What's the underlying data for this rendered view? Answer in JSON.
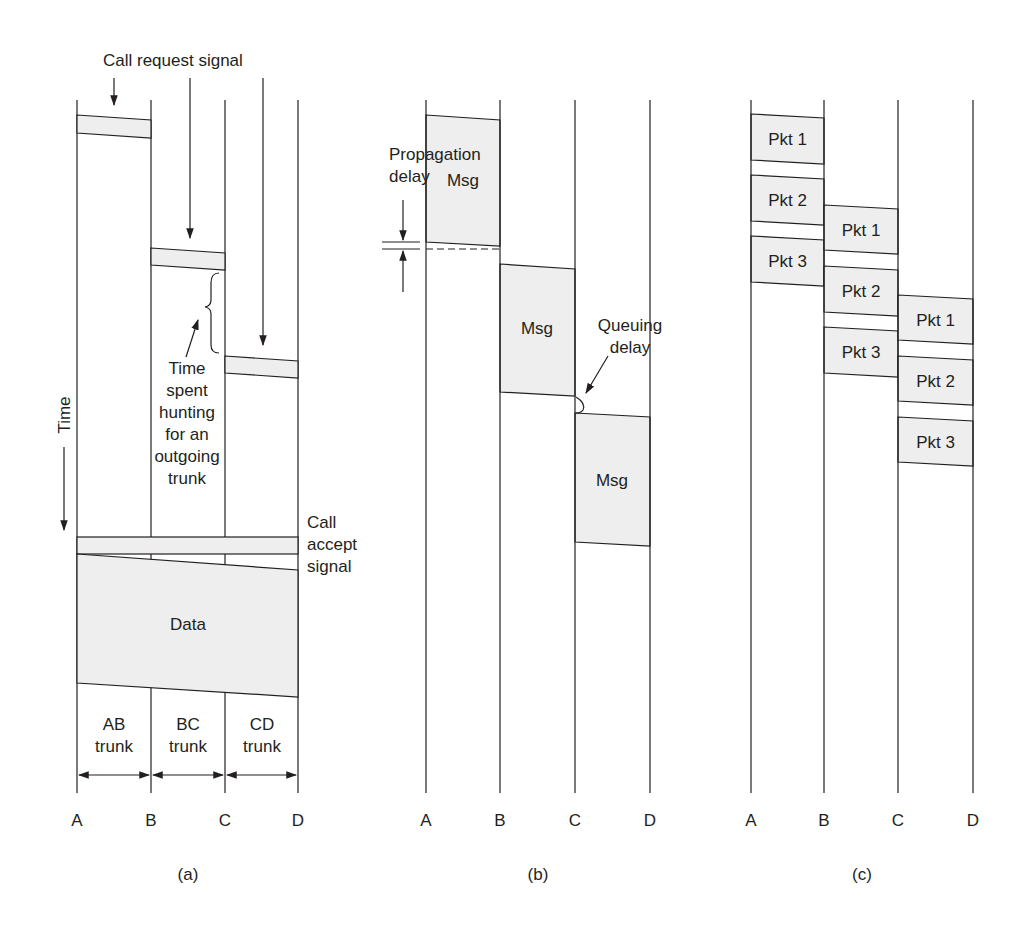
{
  "colors": {
    "ink": "#231f20",
    "fill": "#eeeeee",
    "background": "#ffffff"
  },
  "panels": [
    {
      "id": "a",
      "caption": "(a)",
      "caption_pos": [
        188,
        880
      ],
      "nodes": [
        {
          "label": "A",
          "x": 77
        },
        {
          "label": "B",
          "x": 151
        },
        {
          "label": "C",
          "x": 225
        },
        {
          "label": "D",
          "x": 298
        }
      ],
      "line_top": 100,
      "line_bottom": 793,
      "node_label_y": 826,
      "signal_boxes": [
        {
          "x1": 77,
          "x2": 151,
          "top": [
            115,
            120
          ],
          "bottom": [
            133,
            138
          ]
        },
        {
          "x1": 151,
          "x2": 225,
          "top": [
            248,
            253
          ],
          "bottom": [
            265,
            270
          ]
        },
        {
          "x1": 225,
          "x2": 298,
          "top": [
            356,
            361
          ],
          "bottom": [
            373,
            378
          ]
        }
      ],
      "call_accept_band": {
        "x1": 77,
        "x2": 298,
        "top": 537,
        "bottom": 554
      },
      "data_block": {
        "x1": 77,
        "x2": 298,
        "top": [
          554,
          570
        ],
        "bottom": [
          683,
          697
        ],
        "label": "Data",
        "label_pos": [
          188,
          630
        ]
      },
      "labels": {
        "call_request": {
          "text": "Call request signal",
          "x": 103,
          "y": 66
        },
        "call_accept": {
          "lines": [
            "Call",
            "accept",
            "signal"
          ],
          "x": 307,
          "y": 528,
          "line_height": 22
        },
        "hunting": {
          "lines": [
            "Time",
            "spent",
            "hunting",
            "for an",
            "outgoing",
            "trunk"
          ],
          "x": 187,
          "y": 374,
          "line_height": 22
        },
        "time_axis": {
          "text": "Time",
          "x": 70,
          "y": 415
        }
      },
      "trunks": [
        {
          "lines": [
            "AB",
            "trunk"
          ],
          "x": 114
        },
        {
          "lines": [
            "BC",
            "trunk"
          ],
          "x": 188
        },
        {
          "lines": [
            "CD",
            "trunk"
          ],
          "x": 262
        }
      ],
      "trunk_label_y": 730,
      "trunk_arrow_y": 775
    },
    {
      "id": "b",
      "caption": "(b)",
      "caption_pos": [
        538,
        880
      ],
      "nodes": [
        {
          "label": "A",
          "x": 426
        },
        {
          "label": "B",
          "x": 500
        },
        {
          "label": "C",
          "x": 575
        },
        {
          "label": "D",
          "x": 650
        }
      ],
      "line_top": 100,
      "line_bottom": 793,
      "node_label_y": 826,
      "msg_boxes": [
        {
          "x1": 426,
          "x2": 500,
          "top": [
            115,
            120
          ],
          "bottom": [
            242,
            246
          ],
          "label": "Msg",
          "label_pos": [
            463,
            186
          ]
        },
        {
          "x1": 500,
          "x2": 575,
          "top": [
            264,
            269
          ],
          "bottom": [
            392,
            396
          ],
          "label": "Msg",
          "label_pos": [
            537,
            334
          ]
        },
        {
          "x1": 575,
          "x2": 650,
          "top": [
            413,
            417
          ],
          "bottom": [
            542,
            546
          ],
          "label": "Msg",
          "label_pos": [
            612,
            486
          ]
        }
      ],
      "labels": {
        "propagation": {
          "lines": [
            "Propagation",
            "delay"
          ],
          "x": 389,
          "y": 160,
          "line_height": 22
        },
        "queuing": {
          "lines": [
            "Queuing",
            "delay"
          ],
          "x": 630,
          "y": 331,
          "line_height": 22
        }
      },
      "propagation_marker": {
        "x1": 382,
        "x2": 420,
        "y_top": 242,
        "y_bottom": 249,
        "dash_x1": 426,
        "dash_x2": 500
      }
    },
    {
      "id": "c",
      "caption": "(c)",
      "caption_pos": [
        862,
        880
      ],
      "nodes": [
        {
          "label": "A",
          "x": 751
        },
        {
          "label": "B",
          "x": 824
        },
        {
          "label": "C",
          "x": 898
        },
        {
          "label": "D",
          "x": 973
        }
      ],
      "line_top": 100,
      "line_bottom": 793,
      "node_label_y": 826,
      "packets": [
        {
          "x1": 751,
          "x2": 824,
          "top": [
            114,
            118
          ],
          "bottom": [
            160,
            164
          ],
          "label": "Pkt 1"
        },
        {
          "x1": 751,
          "x2": 824,
          "top": [
            175,
            179
          ],
          "bottom": [
            221,
            225
          ],
          "label": "Pkt 2"
        },
        {
          "x1": 751,
          "x2": 824,
          "top": [
            236,
            240
          ],
          "bottom": [
            282,
            286
          ],
          "label": "Pkt 3"
        },
        {
          "x1": 824,
          "x2": 898,
          "top": [
            205,
            209
          ],
          "bottom": [
            250,
            254
          ],
          "label": "Pkt 1"
        },
        {
          "x1": 824,
          "x2": 898,
          "top": [
            266,
            270
          ],
          "bottom": [
            312,
            316
          ],
          "label": "Pkt 2"
        },
        {
          "x1": 824,
          "x2": 898,
          "top": [
            327,
            331
          ],
          "bottom": [
            373,
            377
          ],
          "label": "Pkt 3"
        },
        {
          "x1": 898,
          "x2": 973,
          "top": [
            295,
            299
          ],
          "bottom": [
            340,
            344
          ],
          "label": "Pkt 1"
        },
        {
          "x1": 898,
          "x2": 973,
          "top": [
            356,
            360
          ],
          "bottom": [
            401,
            405
          ],
          "label": "Pkt 2"
        },
        {
          "x1": 898,
          "x2": 973,
          "top": [
            417,
            421
          ],
          "bottom": [
            462,
            466
          ],
          "label": "Pkt 3"
        }
      ]
    }
  ]
}
